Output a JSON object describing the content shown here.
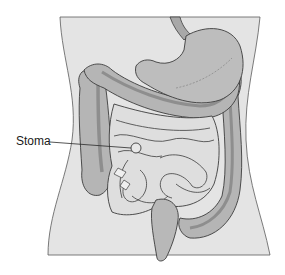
{
  "figure": {
    "labels": [
      {
        "id": "stoma",
        "text": "Stoma",
        "x": 16,
        "y": 135
      }
    ]
  },
  "colors": {
    "background": "#ffffff",
    "torso_fill": "#e4e4e4",
    "outline": "#3c3c3c",
    "stomach_fill": "#bdbdbd",
    "colon_fill": "#b5b5b5",
    "colon_band": "#8e8e8e",
    "small_intestine_fill": "#dedede",
    "rectum_fill": "#b8b8b8"
  }
}
